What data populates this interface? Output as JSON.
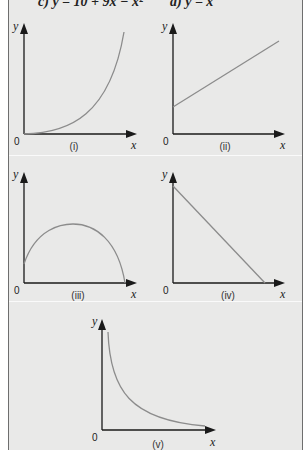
{
  "header": {
    "equation_c": "c) y = 10 + 9x − x²",
    "equation_d": "d) y = x"
  },
  "graphs": [
    {
      "id": "i",
      "caption": "(i)",
      "shape": "exponential-increasing curve from origin",
      "y_label": "y",
      "x_label": "x",
      "origin_label": "0"
    },
    {
      "id": "ii",
      "caption": "(ii)",
      "shape": "straight line with positive slope and positive y-intercept",
      "y_label": "y",
      "x_label": "x",
      "origin_label": "0"
    },
    {
      "id": "iii",
      "caption": "(iii)",
      "shape": "inverted parabola with positive y-intercept",
      "y_label": "y",
      "x_label": "x",
      "origin_label": "0"
    },
    {
      "id": "iv",
      "caption": "(iv)",
      "shape": "straight line with negative slope",
      "y_label": "y",
      "x_label": "x",
      "origin_label": "0"
    },
    {
      "id": "v",
      "caption": "(v)",
      "shape": "reciprocal / hyperbola decay curve",
      "y_label": "y",
      "x_label": "x",
      "origin_label": "0"
    }
  ],
  "colors": {
    "panel_bg": "#e9e9e8",
    "axis": "#1a1a1a",
    "curve": "#8c8c8c",
    "border": "#6e6e6e"
  }
}
